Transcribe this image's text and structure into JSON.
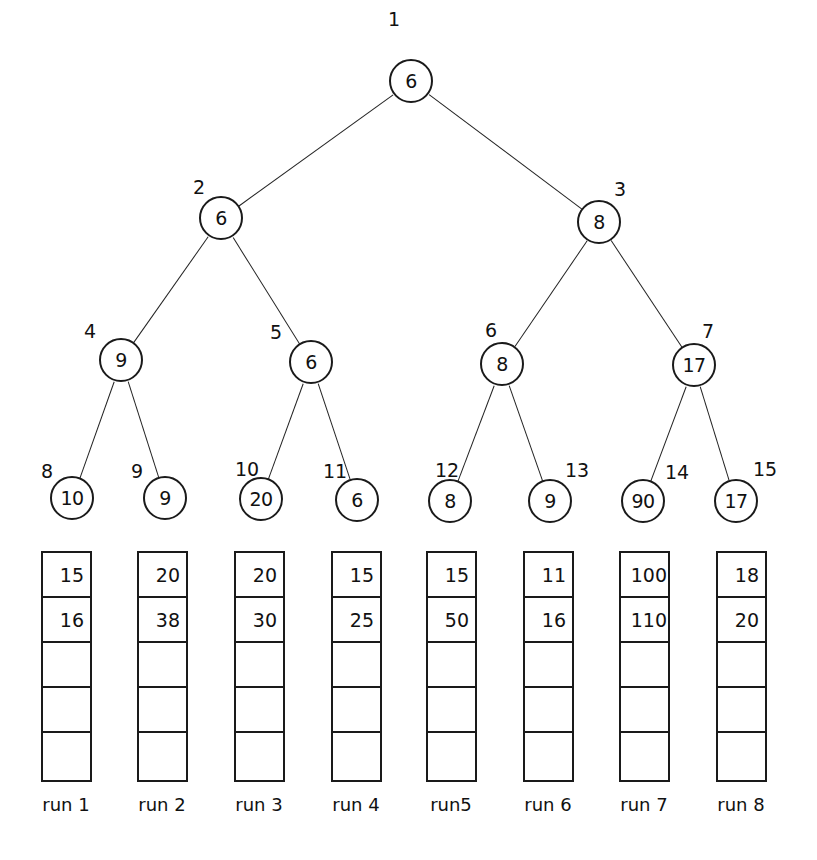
{
  "diagram": {
    "type": "tournament-tree-with-runs",
    "nodes": [
      {
        "index": "1",
        "value": "6",
        "cx": 411,
        "cy": 81,
        "lx": 388,
        "ly": 10,
        "parent": null
      },
      {
        "index": "2",
        "value": "6",
        "cx": 221,
        "cy": 218,
        "lx": 193,
        "ly": 178,
        "parent": 0
      },
      {
        "index": "3",
        "value": "8",
        "cx": 599,
        "cy": 222,
        "lx": 614,
        "ly": 180,
        "parent": 0
      },
      {
        "index": "4",
        "value": "9",
        "cx": 121,
        "cy": 360,
        "lx": 84,
        "ly": 322,
        "parent": 1
      },
      {
        "index": "5",
        "value": "6",
        "cx": 311,
        "cy": 362,
        "lx": 270,
        "ly": 323,
        "parent": 1
      },
      {
        "index": "6",
        "value": "8",
        "cx": 502,
        "cy": 364,
        "lx": 485,
        "ly": 321,
        "parent": 2
      },
      {
        "index": "7",
        "value": "17",
        "cx": 694,
        "cy": 365,
        "lx": 702,
        "ly": 322,
        "parent": 2
      },
      {
        "index": "8",
        "value": "10",
        "cx": 72,
        "cy": 498,
        "lx": 41,
        "ly": 462,
        "parent": 3
      },
      {
        "index": "9",
        "value": "9",
        "cx": 165,
        "cy": 498,
        "lx": 131,
        "ly": 462,
        "parent": 3
      },
      {
        "index": "10",
        "value": "20",
        "cx": 261,
        "cy": 499,
        "lx": 235,
        "ly": 460,
        "parent": 4
      },
      {
        "index": "11",
        "value": "6",
        "cx": 357,
        "cy": 500,
        "lx": 323,
        "ly": 462,
        "parent": 4
      },
      {
        "index": "12",
        "value": "8",
        "cx": 450,
        "cy": 501,
        "lx": 435,
        "ly": 461,
        "parent": 5
      },
      {
        "index": "13",
        "value": "9",
        "cx": 550,
        "cy": 501,
        "lx": 565,
        "ly": 461,
        "parent": 5
      },
      {
        "index": "14",
        "value": "90",
        "cx": 643,
        "cy": 501,
        "lx": 665,
        "ly": 463,
        "parent": 6
      },
      {
        "index": "15",
        "value": "17",
        "cx": 736,
        "cy": 501,
        "lx": 753,
        "ly": 460,
        "parent": 6
      }
    ],
    "runs": [
      {
        "label": "run 1",
        "x": 41,
        "cells": [
          "15",
          "16",
          "",
          "",
          ""
        ]
      },
      {
        "label": "run 2",
        "x": 137,
        "cells": [
          "20",
          "38",
          "",
          "",
          ""
        ]
      },
      {
        "label": "run 3",
        "x": 234,
        "cells": [
          "20",
          "30",
          "",
          "",
          ""
        ]
      },
      {
        "label": "run 4",
        "x": 331,
        "cells": [
          "15",
          "25",
          "",
          "",
          ""
        ]
      },
      {
        "label": "run5",
        "x": 426,
        "cells": [
          "15",
          "50",
          "",
          "",
          ""
        ]
      },
      {
        "label": "run 6",
        "x": 523,
        "cells": [
          "11",
          "16",
          "",
          "",
          ""
        ]
      },
      {
        "label": "run 7",
        "x": 619,
        "cells": [
          "100",
          "110",
          "",
          "",
          ""
        ]
      },
      {
        "label": "run 8",
        "x": 716,
        "cells": [
          "18",
          "20",
          "",
          "",
          ""
        ]
      }
    ],
    "runs_top": 551,
    "label_top": 794,
    "colors": {
      "stroke": "#1a1a1a",
      "background": "#ffffff"
    }
  }
}
